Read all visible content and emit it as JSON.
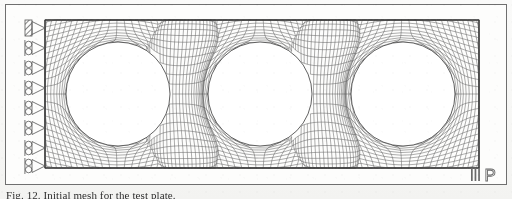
{
  "figure": {
    "type": "finite-element-mesh",
    "title": "Initial mesh",
    "frame": {
      "stroke": "#6f6f6f",
      "fill": "#fdfdfc"
    },
    "mesh": {
      "stroke": "#4a4a4a",
      "line_width": 0.45,
      "plate": {
        "x": 40,
        "y": 16,
        "width": 434,
        "height": 148
      },
      "divisions_x": 96,
      "divisions_y": 32,
      "holes": [
        {
          "label": "hole-1",
          "cx": 113,
          "cy": 90,
          "r": 52
        },
        {
          "label": "hole-2",
          "cx": 255,
          "cy": 90,
          "r": 52
        },
        {
          "label": "hole-3",
          "cx": 398,
          "cy": 90,
          "r": 52
        }
      ]
    },
    "supports": {
      "type": "roller-and-fixed",
      "stroke": "#555555",
      "edge_x": 40,
      "items": [
        {
          "name": "support-fixed-1",
          "kind": "fixed",
          "y": 24
        },
        {
          "name": "support-roller-2",
          "kind": "roller",
          "y": 44
        },
        {
          "name": "support-roller-3",
          "kind": "roller",
          "y": 64
        },
        {
          "name": "support-roller-4",
          "kind": "roller",
          "y": 84
        },
        {
          "name": "support-roller-5",
          "kind": "roller",
          "y": 104
        },
        {
          "name": "support-roller-6",
          "kind": "roller",
          "y": 124
        },
        {
          "name": "support-roller-7",
          "kind": "roller",
          "y": 144
        },
        {
          "name": "support-roller-8",
          "kind": "roller",
          "y": 162
        }
      ]
    },
    "logo": {
      "name": "publisher-logo",
      "bars": 3,
      "letter": "P",
      "color": "#6b6b6b"
    }
  },
  "caption": {
    "text": "Fig. 12. Initial mesh for the test plate.",
    "clipped": true
  }
}
